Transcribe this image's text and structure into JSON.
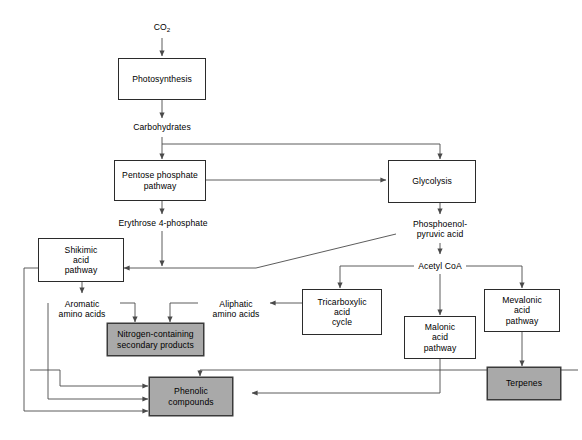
{
  "diagram": {
    "width": 582,
    "height": 440,
    "background_color": "#ffffff",
    "line_color": "#4a4a4a",
    "box_border_color": "#2b2b2b",
    "shaded_fill_color": "#a9a9a9",
    "text_color": "#000000"
  },
  "nodes": {
    "co2": {
      "label": "CO",
      "sub": "2",
      "type": "plain"
    },
    "photosynthesis": {
      "label": "Photosynthesis",
      "type": "box"
    },
    "carbohydrates": {
      "label": "Carbohydrates",
      "type": "plain"
    },
    "pentose_phosphate_pathway": {
      "label": "Pentose phosphate\npathway",
      "type": "box"
    },
    "glycolysis": {
      "label": "Glycolysis",
      "type": "box"
    },
    "erythrose_4_phosphate": {
      "label": "Erythrose 4-phosphate",
      "type": "plain"
    },
    "phosphoenolpyruvic_acid": {
      "label": "Phosphoenol-\npyruvic acid",
      "type": "plain"
    },
    "shikimic_acid_pathway": {
      "label": "Shikimic\nacid\npathway",
      "type": "box"
    },
    "acetyl_coa": {
      "label": "Acetyl CoA",
      "type": "plain"
    },
    "aromatic_amino_acids": {
      "label": "Aromatic\namino acids",
      "type": "plain"
    },
    "aliphatic_amino_acids": {
      "label": "Aliphatic\namino acids",
      "type": "plain"
    },
    "tricarboxylic_acid_cycle": {
      "label": "Tricarboxylic\nacid\ncycle",
      "type": "box"
    },
    "mevalonic_acid_pathway": {
      "label": "Mevalonic\nacid\npathway",
      "type": "box"
    },
    "nitrogen_containing_secondary_products": {
      "label": "Nitrogen-containing\nsecondary products",
      "type": "box-shaded"
    },
    "malonic_acid_pathway": {
      "label": "Malonic\nacid\npathway",
      "type": "box"
    },
    "terpenes": {
      "label": "Terpenes",
      "type": "box-shaded"
    },
    "phenolic_compounds": {
      "label": "Phenolic\ncompounds",
      "type": "box-shaded"
    }
  }
}
